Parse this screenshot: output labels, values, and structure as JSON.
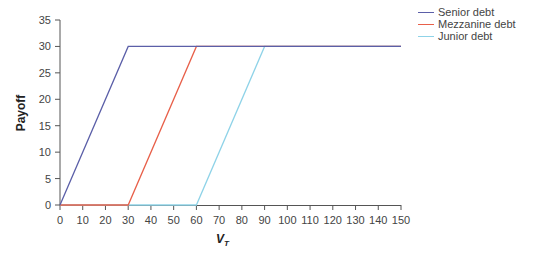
{
  "chart_data": {
    "type": "line",
    "title": "",
    "xlabel": "V_T",
    "ylabel": "Payoff",
    "xlim": [
      0,
      150
    ],
    "ylim": [
      0,
      35
    ],
    "x_ticks": [
      0,
      10,
      20,
      30,
      40,
      50,
      60,
      70,
      80,
      90,
      100,
      110,
      120,
      130,
      140,
      150
    ],
    "y_ticks": [
      0,
      5,
      10,
      15,
      20,
      25,
      30,
      35
    ],
    "grid": false,
    "legend_position": "top-right",
    "series": [
      {
        "name": "Senior debt",
        "color": "#5b5fa8",
        "x": [
          0,
          30,
          150
        ],
        "y": [
          0,
          30,
          30
        ]
      },
      {
        "name": "Mezzanine debt",
        "color": "#e8604a",
        "x": [
          0,
          30,
          60,
          150
        ],
        "y": [
          0,
          0,
          30,
          30
        ]
      },
      {
        "name": "Junior debt",
        "color": "#8fd3e8",
        "x": [
          0,
          60,
          90,
          150
        ],
        "y": [
          0,
          0,
          30,
          30
        ]
      }
    ]
  },
  "legend": {
    "items": [
      {
        "label": "Senior debt",
        "color": "#5b5fa8"
      },
      {
        "label": "Mezzanine debt",
        "color": "#e8604a"
      },
      {
        "label": "Junior debt",
        "color": "#8fd3e8"
      }
    ]
  },
  "axes": {
    "x_title_main": "V",
    "x_title_sub": "T",
    "y_title": "Payoff"
  }
}
